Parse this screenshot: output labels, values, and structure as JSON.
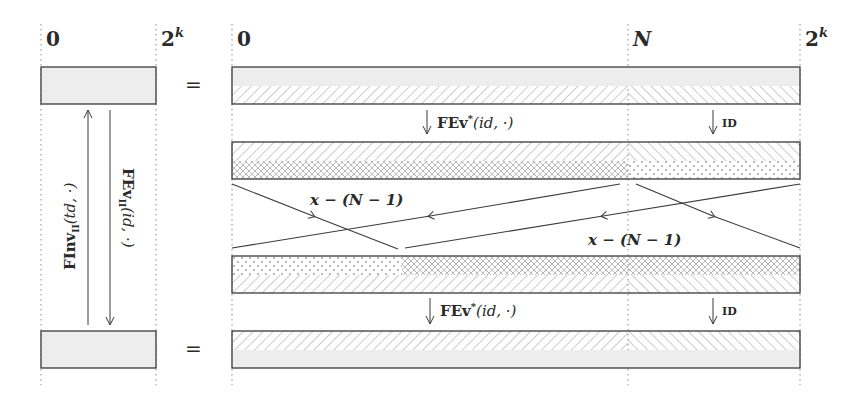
{
  "diagram": {
    "colors": {
      "stroke": "#3a3a3a",
      "fill_gray": "#ededed",
      "hatch": "#9a9a9a",
      "guide": "#8a8a8a",
      "text": "#2a2a2a"
    },
    "axis_labels": {
      "left_start": "0",
      "left_end": "2",
      "left_end_exp": "k",
      "right_start": "0",
      "right_mid": "N",
      "right_end": "2",
      "right_end_exp": "k"
    },
    "equals_top": "=",
    "equals_bottom": "=",
    "left_arrows": {
      "up_label_main": "FInv",
      "up_label_sub": "II",
      "up_label_args": "(td, ·)",
      "down_label_main": "FEv",
      "down_label_sub": "II",
      "down_label_args": "(id, ·)"
    },
    "transitions": {
      "top_left_label_main": "FEv",
      "top_left_label_sup": "*",
      "top_left_label_args": "(id, ·)",
      "top_right_label": "ID",
      "bottom_left_label_main": "FEv",
      "bottom_left_label_sup": "*",
      "bottom_left_label_args": "(id, ·)",
      "bottom_right_label": "ID"
    },
    "shift_labels": {
      "upper_left": "x − (N − 1)",
      "lower_right": "x − (N − 1)"
    },
    "rows": [
      {
        "name": "row-1",
        "segments": [
          "gray+hatch-forward",
          "gray+hatch-backward"
        ]
      },
      {
        "name": "row-2",
        "segments": [
          "hatch-forward+crosshatch",
          "hatch-backward+dots"
        ]
      },
      {
        "name": "row-3",
        "segments": [
          "dots+hatch-forward",
          "crosshatch+hatch-backward"
        ]
      },
      {
        "name": "row-4",
        "segments": [
          "hatch-forward+gray",
          "hatch-backward+gray"
        ]
      }
    ]
  }
}
